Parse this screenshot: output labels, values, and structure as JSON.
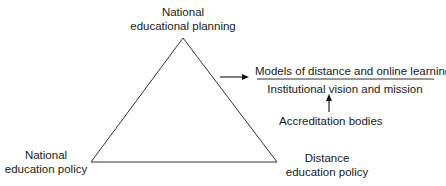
{
  "diagram": {
    "triangle": {
      "top_label": [
        "National",
        "educational planning"
      ],
      "left_label": [
        "National",
        "education policy"
      ],
      "right_label": [
        "Distance",
        "education policy"
      ]
    },
    "outcome": {
      "title": "Models of distance and online learning",
      "subtitle": "Institutional vision and mission",
      "influence": "Accreditation bodies"
    },
    "colors": {
      "line": "#333333",
      "text": "#1a1a1a",
      "background": "#ffffff"
    }
  }
}
